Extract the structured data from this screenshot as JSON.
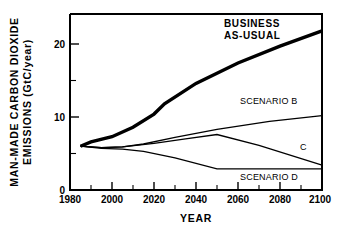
{
  "chart_data": {
    "type": "line",
    "title": "",
    "xlabel": "YEAR",
    "ylabel_line1": "MAN-MADE CARBON DIOXIDE",
    "ylabel_line2": "EMISSIONS  (GtC/year)",
    "xlim": [
      1980,
      2100
    ],
    "ylim": [
      0,
      24
    ],
    "xticks": [
      1980,
      2000,
      2020,
      2040,
      2060,
      2080,
      2100
    ],
    "xtick_labels": [
      "1980",
      "2000",
      "2020",
      "2040",
      "2060",
      "2080",
      "2100"
    ],
    "xminor_ticks": [
      1990,
      2010,
      2030,
      2050,
      2070,
      2090
    ],
    "yticks": [
      0,
      10,
      20
    ],
    "ytick_labels": [
      "0",
      "10",
      "20"
    ],
    "yminor_ticks": [
      5,
      15
    ],
    "grid": false,
    "legend_position": "inline-annotations",
    "series": [
      {
        "name": "BUSINESS AS-USUAL",
        "label": "BUSINESS AS-USUAL",
        "style": "thick",
        "x": [
          1985,
          1990,
          2000,
          2010,
          2020,
          2025,
          2040,
          2060,
          2080,
          2100
        ],
        "values": [
          6.0,
          6.6,
          7.3,
          8.6,
          10.4,
          11.8,
          14.6,
          17.4,
          19.7,
          21.8
        ]
      },
      {
        "name": "SCENARIO B",
        "label": "SCENARIO B",
        "style": "thin",
        "x": [
          1985,
          1995,
          2005,
          2015,
          2030,
          2050,
          2075,
          2100
        ],
        "values": [
          6.0,
          5.8,
          5.9,
          6.3,
          7.2,
          8.3,
          9.4,
          10.2
        ]
      },
      {
        "name": "SCENARIO C",
        "label": "C",
        "style": "thin",
        "x": [
          1985,
          1995,
          2005,
          2020,
          2035,
          2050,
          2070,
          2100
        ],
        "values": [
          6.0,
          5.8,
          5.9,
          6.4,
          7.0,
          7.6,
          6.1,
          3.4
        ]
      },
      {
        "name": "SCENARIO D",
        "label": "SCENARIO D",
        "style": "thin",
        "x": [
          1985,
          1995,
          2005,
          2015,
          2030,
          2050,
          2070,
          2100
        ],
        "values": [
          6.0,
          5.7,
          5.6,
          5.3,
          4.4,
          2.9,
          2.9,
          2.9
        ]
      }
    ],
    "annotations": [
      {
        "text": "BUSINESS",
        "x": 2062,
        "y": 23.2,
        "style": "bold"
      },
      {
        "text": "AS-USUAL",
        "x": 2062,
        "y": 21.6,
        "style": "bold"
      },
      {
        "text": "SCENARIO B",
        "x": 2070,
        "y": 11.9,
        "style": "plain"
      },
      {
        "text": "C",
        "x": 2091,
        "y": 5.8,
        "style": "plain"
      },
      {
        "text": "SCENARIO D",
        "x": 2070,
        "y": 1.7,
        "style": "plain"
      }
    ]
  },
  "colors": {
    "background": "#ffffff",
    "foreground": "#000000",
    "curve": "#000000"
  }
}
